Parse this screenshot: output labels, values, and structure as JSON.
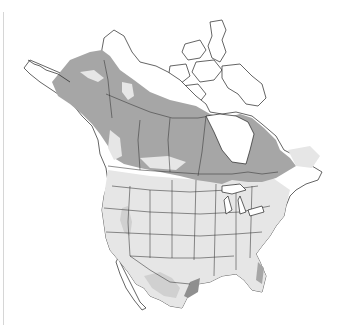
{
  "map": {
    "type": "species-range-map",
    "region": "North America",
    "legend_colors": {
      "breeding": "#a6a6a6",
      "nonbreeding": "#e6e6e6",
      "migration_pale": "#d4d4d4",
      "year_round": "#8f8f8f",
      "land": "#ffffff",
      "outline": "#222222"
    }
  }
}
